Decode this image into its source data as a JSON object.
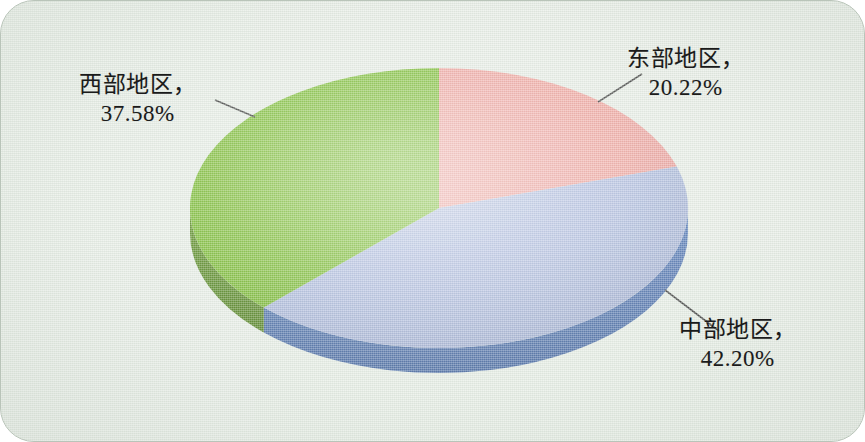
{
  "figure": {
    "background_color": "#e5ece4",
    "border_color": "#b9c4b9"
  },
  "chart_data": {
    "type": "pie",
    "title": "",
    "subtitle": "",
    "xlabel": "",
    "ylabel": "",
    "legend_position": "none",
    "grid": false,
    "three_d": true,
    "label_format": "{name}，{value}%",
    "categories": [
      "东部地区",
      "中部地区",
      "西部地区"
    ],
    "values": [
      20.22,
      42.2,
      42.2
    ],
    "slices": [
      {
        "name": "东部地区",
        "value": 20.22,
        "value_text": "20.22%",
        "label_line1": "东部地区，",
        "label_line2": "20.22%",
        "color": "#ee9b96",
        "side_color": "#d4756f",
        "start_angle_deg": 0,
        "end_angle_deg": 72.79
      },
      {
        "name": "中部地区",
        "value": 42.2,
        "value_text": "42.20%",
        "label_line1": "中部地区，",
        "label_line2": "42.20%",
        "color": "#a7b5dc",
        "side_color": "#4d73b5",
        "start_angle_deg": 72.79,
        "end_angle_deg": 224.71
      },
      {
        "name": "西部地区",
        "value": 37.58,
        "value_text": "37.58%",
        "label_line1": "西部地区，",
        "label_line2": "37.58%",
        "color": "#6fb520",
        "side_color": "#53881a",
        "start_angle_deg": 224.71,
        "end_angle_deg": 360
      }
    ]
  }
}
